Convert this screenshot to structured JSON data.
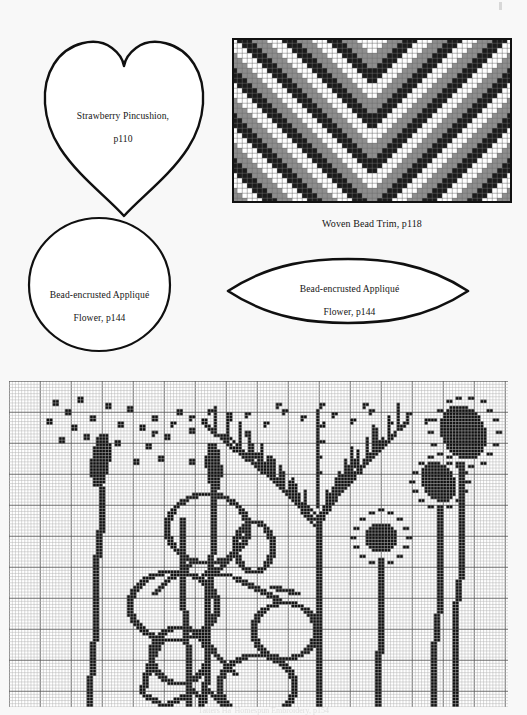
{
  "page": {
    "background_color": "#f8f8f8",
    "ink_color": "#101010",
    "bottom_caption": "Tatters Ha' Homespun Embroidery, p154"
  },
  "templates": [
    {
      "id": "strawberry-pincushion",
      "shape": "heart",
      "label": "Strawberry Pincushion,\np110",
      "label_line1": "Strawberry Pincushion,",
      "label_line2": "p110",
      "page_ref": "p110",
      "box": {
        "x": 40,
        "y": 30,
        "w": 165,
        "h": 185
      }
    },
    {
      "id": "applique-flower-circle",
      "shape": "circle",
      "label": "Bead-encrusted Appliqué\nFlower, p144",
      "label_line1": "Bead-encrusted Appliqué",
      "label_line2": "Flower, p144",
      "page_ref": "p144",
      "box": {
        "x": 27,
        "y": 217,
        "w": 142,
        "h": 133
      }
    },
    {
      "id": "applique-flower-leaf",
      "shape": "lens",
      "label": "Bead-encrusted Appliqué\nFlower, p144",
      "label_line1": "Bead-encrusted Appliqué",
      "label_line2": "Flower, p144",
      "page_ref": "p144",
      "box": {
        "x": 226,
        "y": 258,
        "w": 242,
        "h": 64
      }
    }
  ],
  "charts": {
    "woven_bead_trim": {
      "caption": "Woven Bead Trim, p118",
      "page_ref": "p118",
      "box": {
        "x": 232,
        "y": 38,
        "w": 281,
        "h": 165
      },
      "cell": 5,
      "cols": 56,
      "rows": 33,
      "palette": {
        "light": "#ffffff",
        "mid": "#8e8e8e",
        "dark": "#1b1b1b"
      },
      "grid_line": "#6d6d6d",
      "outline": "#111111",
      "pattern": "mirrored chevron bands: repeating light / mid / dark diagonal stripes meeting at a centre peak"
    },
    "embroidery_chart": {
      "box": {
        "x": 9,
        "y": 381,
        "w": 500,
        "h": 325
      },
      "cell": 3.1,
      "cols": 161,
      "rows": 105,
      "grid_line": "#b4b4b4",
      "bold_grid_line": "#5f5f5f",
      "bold_every": 10,
      "stitch_color": "#101010",
      "motifs": [
        "two tall bulrush seed-heads with scattered pollen dots (left)",
        "large looping seed-pod vine with round pods (centre-left)",
        "fern / cow-parsley branching sprays with dotted tips (centre)",
        "three long-stemmed dotted poppy-head flowers (right)"
      ]
    }
  }
}
